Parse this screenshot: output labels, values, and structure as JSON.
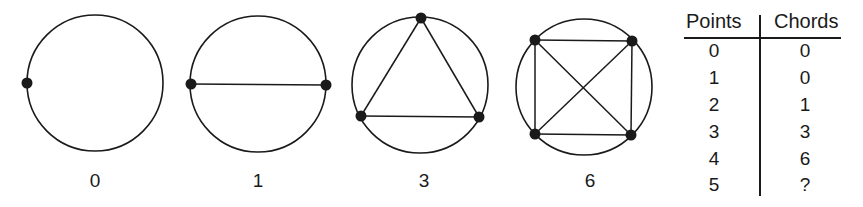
{
  "figures": [
    {
      "label": "0",
      "cx": 95,
      "cy": 83,
      "r": 68,
      "points": [
        [
          27,
          83
        ]
      ],
      "chords": []
    },
    {
      "label": "1",
      "cx": 258,
      "cy": 84,
      "r": 68,
      "points": [
        [
          191,
          84
        ],
        [
          326,
          85
        ]
      ],
      "chords": [
        [
          0,
          1
        ]
      ]
    },
    {
      "label": "3",
      "cx": 420,
      "cy": 85,
      "r": 68,
      "points": [
        [
          421,
          18
        ],
        [
          361,
          116
        ],
        [
          479,
          117
        ]
      ],
      "chords": [
        [
          0,
          1
        ],
        [
          0,
          2
        ],
        [
          1,
          2
        ]
      ]
    },
    {
      "label": "6",
      "cx": 584,
      "cy": 87,
      "r": 68,
      "points": [
        [
          535,
          40
        ],
        [
          632,
          41
        ],
        [
          535,
          134
        ],
        [
          631,
          135
        ]
      ],
      "chords": [
        [
          0,
          1
        ],
        [
          0,
          2
        ],
        [
          0,
          3
        ],
        [
          1,
          2
        ],
        [
          1,
          3
        ],
        [
          2,
          3
        ]
      ]
    }
  ],
  "table": {
    "headers": [
      "Points",
      "Chords"
    ],
    "rows": [
      [
        "0",
        "0"
      ],
      [
        "1",
        "0"
      ],
      [
        "2",
        "1"
      ],
      [
        "3",
        "3"
      ],
      [
        "4",
        "6"
      ],
      [
        "5",
        "?"
      ]
    ]
  },
  "colors": {
    "ink": "#1a1a1a",
    "background": "#ffffff"
  }
}
